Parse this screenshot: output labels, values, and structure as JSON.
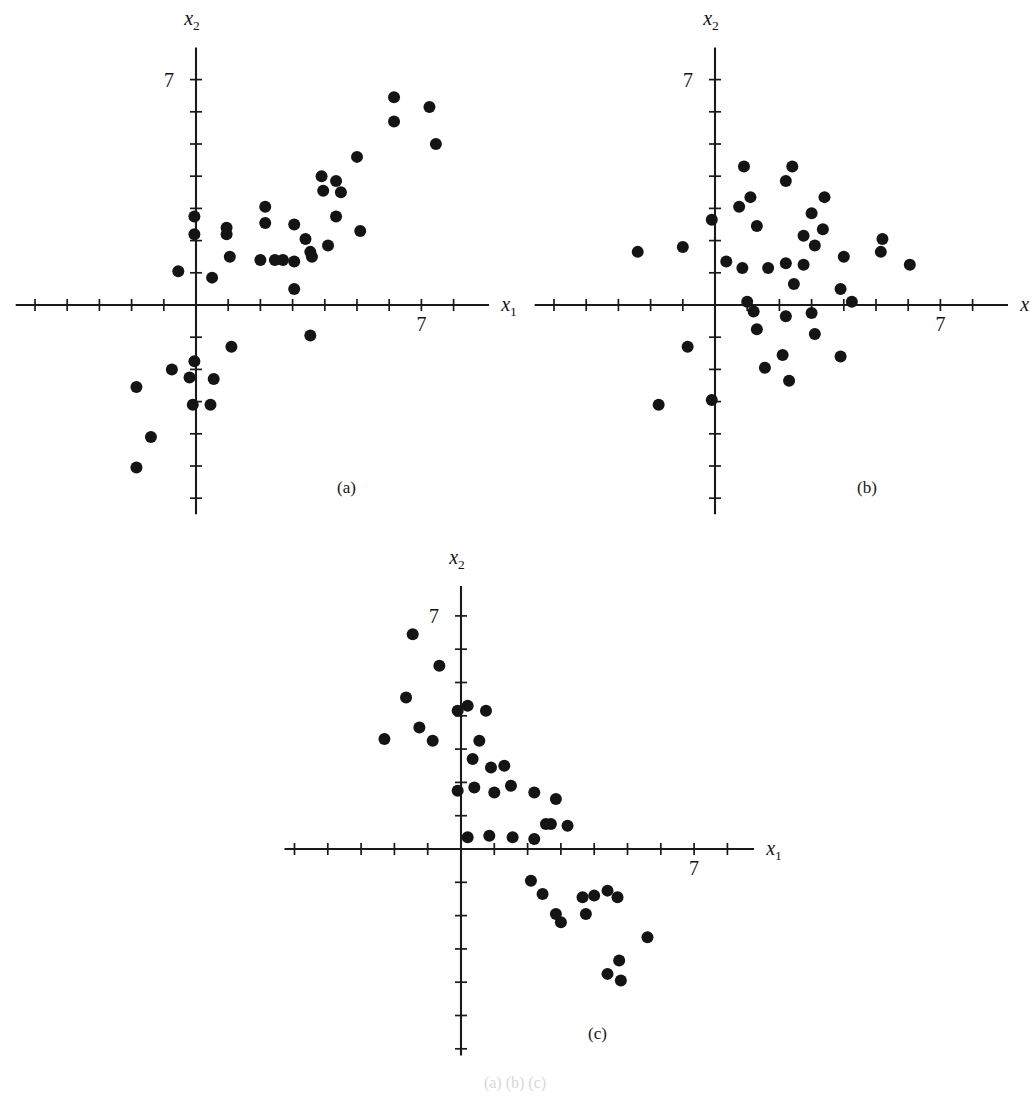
{
  "figure": {
    "axis_label_x": "x",
    "axis_label_x_sub": "1",
    "axis_label_y": "x",
    "axis_label_y_sub": "2",
    "tick_value_label": "7",
    "bottom_caption": "(a) (b) (c)"
  },
  "panels": [
    {
      "id": "a",
      "caption": "(a)",
      "caption_left": 337,
      "caption_top": 478,
      "origin_x": 196,
      "origin_y": 305,
      "unit": 32.2,
      "x_axis_start": -5.6,
      "x_axis_end": 9.1,
      "y_axis_start": -6.5,
      "y_axis_end": 8.0,
      "x_ticks": [
        -5,
        -4,
        -3,
        -2,
        -1,
        1,
        2,
        3,
        4,
        5,
        6,
        7,
        8
      ],
      "y_ticks": [
        -6,
        -5,
        -4,
        -3,
        -2,
        -1,
        1,
        2,
        3,
        4,
        5,
        6,
        7
      ],
      "x_label_offset_x": 20,
      "x_label_offset_y": 6,
      "y_label_offset_x": -4,
      "y_label_offset_y": -22,
      "x_tick_label_value": 7,
      "x_tick_label_dx": 0,
      "x_tick_label_dy": 26,
      "y_tick_label_value": 7,
      "y_tick_label_dx": -22,
      "y_tick_label_dy": 7
    },
    {
      "id": "b",
      "caption": "(b)",
      "caption_left": 857,
      "caption_top": 478,
      "origin_x": 715,
      "origin_y": 305,
      "unit": 32.2,
      "x_axis_start": -5.6,
      "x_axis_end": 9.1,
      "y_axis_start": -6.5,
      "y_axis_end": 8.0,
      "x_ticks": [
        -5,
        -4,
        -3,
        -2,
        -1,
        1,
        2,
        3,
        4,
        5,
        6,
        7,
        8
      ],
      "y_ticks": [
        -6,
        -5,
        -4,
        -3,
        -2,
        -1,
        1,
        2,
        3,
        4,
        5,
        6,
        7
      ],
      "x_label_offset_x": 20,
      "x_label_offset_y": 6,
      "y_label_offset_x": -4,
      "y_label_offset_y": -22,
      "x_tick_label_value": 7,
      "x_tick_label_dx": 0,
      "x_tick_label_dy": 26,
      "y_tick_label_value": 7,
      "y_tick_label_dx": -22,
      "y_tick_label_dy": 7
    },
    {
      "id": "c",
      "caption": "(c)",
      "caption_left": 588,
      "caption_top": 1024,
      "origin_x": 461,
      "origin_y": 849,
      "unit": 33.3,
      "x_axis_start": -5.3,
      "x_axis_end": 8.8,
      "y_axis_start": -6.2,
      "y_axis_end": 7.9,
      "x_ticks": [
        -5,
        -4,
        -3,
        -2,
        -1,
        1,
        2,
        3,
        4,
        5,
        6,
        7,
        8
      ],
      "y_ticks": [
        -6,
        -5,
        -4,
        -3,
        -2,
        -1,
        1,
        2,
        3,
        4,
        5,
        6,
        7
      ],
      "x_label_offset_x": 20,
      "x_label_offset_y": 6,
      "y_label_offset_x": -4,
      "y_label_offset_y": -22,
      "x_tick_label_value": 7,
      "x_tick_label_dx": 0,
      "x_tick_label_dy": 26,
      "y_tick_label_value": 7,
      "y_tick_label_dx": -22,
      "y_tick_label_dy": 7
    }
  ],
  "chart_data": [
    {
      "type": "scatter",
      "panel": "a",
      "title": "(a)",
      "xlabel": "x1",
      "ylabel": "x2",
      "xlim": [
        -5.6,
        9.1
      ],
      "ylim": [
        -6.5,
        8.0
      ],
      "grid": false,
      "legend": "none",
      "annotation": "positive correlation",
      "marker_radius_px": 6.0,
      "points": [
        [
          6.15,
          6.45
        ],
        [
          7.25,
          6.15
        ],
        [
          6.15,
          5.7
        ],
        [
          7.45,
          5.0
        ],
        [
          5.0,
          4.6
        ],
        [
          3.9,
          4.0
        ],
        [
          4.35,
          3.85
        ],
        [
          3.95,
          3.55
        ],
        [
          4.5,
          3.5
        ],
        [
          2.15,
          3.05
        ],
        [
          4.35,
          2.75
        ],
        [
          2.15,
          2.55
        ],
        [
          3.05,
          2.5
        ],
        [
          5.1,
          2.3
        ],
        [
          0.95,
          2.4
        ],
        [
          0.95,
          2.2
        ],
        [
          3.4,
          2.05
        ],
        [
          -0.05,
          2.75
        ],
        [
          -0.05,
          2.2
        ],
        [
          4.1,
          1.85
        ],
        [
          3.55,
          1.65
        ],
        [
          3.6,
          1.5
        ],
        [
          1.05,
          1.5
        ],
        [
          2.0,
          1.4
        ],
        [
          2.45,
          1.4
        ],
        [
          3.05,
          1.35
        ],
        [
          2.7,
          1.4
        ],
        [
          -0.55,
          1.05
        ],
        [
          0.5,
          0.85
        ],
        [
          3.05,
          0.5
        ],
        [
          3.55,
          -0.95
        ],
        [
          1.1,
          -1.3
        ],
        [
          -0.05,
          -1.75
        ],
        [
          -0.75,
          -2.0
        ],
        [
          -0.2,
          -2.25
        ],
        [
          0.55,
          -2.3
        ],
        [
          -1.85,
          -2.55
        ],
        [
          -0.1,
          -3.1
        ],
        [
          0.45,
          -3.1
        ],
        [
          -1.4,
          -4.1
        ],
        [
          -1.85,
          -5.05
        ]
      ]
    },
    {
      "type": "scatter",
      "panel": "b",
      "title": "(b)",
      "xlabel": "x1",
      "ylabel": "x2",
      "xlim": [
        -5.6,
        9.1
      ],
      "ylim": [
        -6.5,
        8.0
      ],
      "grid": false,
      "legend": "none",
      "annotation": "no correlation",
      "marker_radius_px": 6.0,
      "points": [
        [
          0.9,
          4.3
        ],
        [
          2.4,
          4.3
        ],
        [
          2.2,
          3.85
        ],
        [
          1.1,
          3.35
        ],
        [
          3.4,
          3.35
        ],
        [
          0.75,
          3.05
        ],
        [
          3.0,
          2.85
        ],
        [
          -0.1,
          2.65
        ],
        [
          1.3,
          2.45
        ],
        [
          3.35,
          2.35
        ],
        [
          2.75,
          2.15
        ],
        [
          5.2,
          2.05
        ],
        [
          -1.0,
          1.8
        ],
        [
          3.1,
          1.85
        ],
        [
          -2.4,
          1.65
        ],
        [
          5.15,
          1.65
        ],
        [
          4.0,
          1.5
        ],
        [
          0.35,
          1.35
        ],
        [
          2.2,
          1.3
        ],
        [
          2.75,
          1.25
        ],
        [
          6.05,
          1.25
        ],
        [
          0.85,
          1.15
        ],
        [
          1.65,
          1.15
        ],
        [
          2.45,
          0.65
        ],
        [
          3.9,
          0.5
        ],
        [
          1.0,
          0.1
        ],
        [
          4.25,
          0.1
        ],
        [
          1.2,
          -0.2
        ],
        [
          3.0,
          -0.25
        ],
        [
          2.2,
          -0.35
        ],
        [
          1.3,
          -0.75
        ],
        [
          3.1,
          -0.9
        ],
        [
          -0.85,
          -1.3
        ],
        [
          2.1,
          -1.55
        ],
        [
          3.9,
          -1.6
        ],
        [
          1.55,
          -1.95
        ],
        [
          2.3,
          -2.35
        ],
        [
          -0.1,
          -2.95
        ],
        [
          -1.75,
          -3.1
        ]
      ]
    },
    {
      "type": "scatter",
      "panel": "c",
      "title": "(c)",
      "xlabel": "x1",
      "ylabel": "x2",
      "xlim": [
        -5.3,
        8.8
      ],
      "ylim": [
        -6.2,
        7.9
      ],
      "grid": false,
      "legend": "none",
      "annotation": "negative correlation",
      "marker_radius_px": 6.0,
      "points": [
        [
          -1.45,
          6.45
        ],
        [
          -0.65,
          5.5
        ],
        [
          -1.65,
          4.55
        ],
        [
          0.2,
          4.3
        ],
        [
          -0.1,
          4.15
        ],
        [
          0.75,
          4.15
        ],
        [
          -1.25,
          3.65
        ],
        [
          -2.3,
          3.3
        ],
        [
          -0.85,
          3.25
        ],
        [
          0.55,
          3.25
        ],
        [
          0.35,
          2.7
        ],
        [
          0.9,
          2.45
        ],
        [
          1.3,
          2.5
        ],
        [
          0.4,
          1.85
        ],
        [
          1.5,
          1.9
        ],
        [
          1.0,
          1.7
        ],
        [
          -0.1,
          1.75
        ],
        [
          2.2,
          1.7
        ],
        [
          2.85,
          1.5
        ],
        [
          2.55,
          0.75
        ],
        [
          2.7,
          0.75
        ],
        [
          3.2,
          0.7
        ],
        [
          0.2,
          0.35
        ],
        [
          0.85,
          0.4
        ],
        [
          1.55,
          0.35
        ],
        [
          2.2,
          0.3
        ],
        [
          2.1,
          -0.95
        ],
        [
          2.45,
          -1.35
        ],
        [
          4.4,
          -1.25
        ],
        [
          3.65,
          -1.45
        ],
        [
          4.0,
          -1.4
        ],
        [
          4.7,
          -1.45
        ],
        [
          2.85,
          -1.95
        ],
        [
          3.75,
          -1.95
        ],
        [
          3.0,
          -2.2
        ],
        [
          5.6,
          -2.65
        ],
        [
          4.75,
          -3.35
        ],
        [
          4.4,
          -3.75
        ],
        [
          4.8,
          -3.95
        ]
      ]
    }
  ]
}
